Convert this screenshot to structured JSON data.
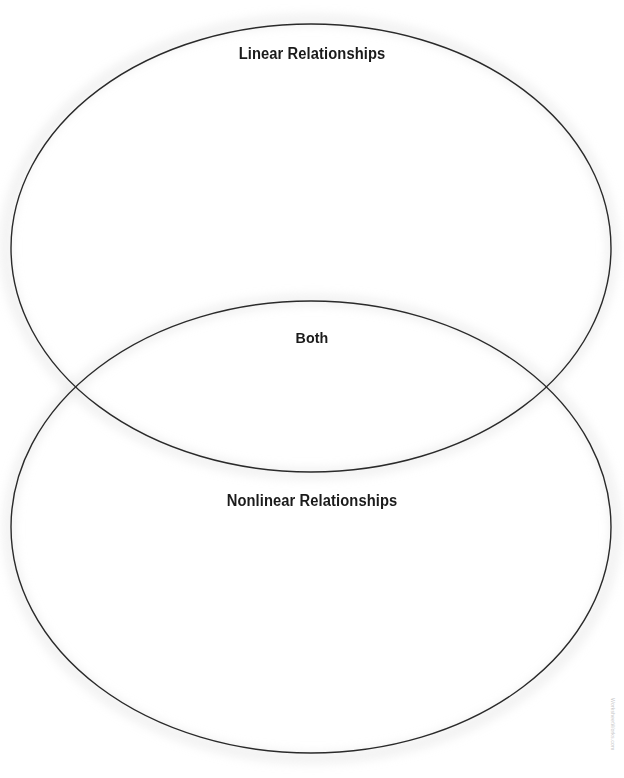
{
  "page": {
    "type": "venn-diagram-worksheet",
    "width": 624,
    "height": 778,
    "background_color": "#ffffff",
    "line_color": "#2a2a2a",
    "text_color": "#1b1b1b",
    "halo_color": "#f0f0f0"
  },
  "diagram": {
    "kind": "two-circle-venn",
    "orientation": "vertical",
    "top_set": {
      "label": "Linear Relationships",
      "center_x": 311,
      "center_y": 248,
      "radius_x": 300,
      "radius_y": 224
    },
    "bottom_set": {
      "label": "Nonlinear Relationships",
      "center_x": 311,
      "center_y": 527,
      "radius_x": 300,
      "radius_y": 226
    },
    "intersection": {
      "label": "Both",
      "point_left_x": 78,
      "point_left_y": 385,
      "point_right_x": 545,
      "point_right_y": 385
    }
  },
  "labels": {
    "top": "Linear Relationships",
    "middle": "Both",
    "bottom": "Nonlinear Relationships"
  },
  "attribution": {
    "text": "WorksheetWorks.com"
  }
}
